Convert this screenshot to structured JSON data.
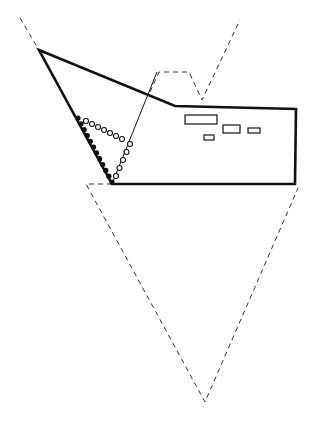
{
  "diagram": {
    "type": "technical line drawing",
    "background": "#ffffff",
    "stroke_color": "#111111",
    "outline": {
      "description": "solid thick outline of object (sloped nose, cabin step, flat body)",
      "points": [
        [
          39,
          50
        ],
        [
          175,
          106
        ],
        [
          296,
          109
        ],
        [
          295,
          184
        ],
        [
          112,
          184
        ]
      ]
    },
    "thin_line": {
      "from": [
        112,
        184
      ],
      "to": [
        157,
        72
      ]
    },
    "dashed_top_left": {
      "from": [
        20,
        18
      ],
      "to": [
        39,
        50
      ]
    },
    "dashed_top_right": {
      "points": [
        [
          150,
          92
        ],
        [
          159,
          72
        ],
        [
          189,
          72
        ],
        [
          202,
          100
        ],
        [
          240,
          20
        ]
      ]
    },
    "dashed_lower_triangle": {
      "points": [
        [
          112,
          184
        ],
        [
          86,
          184
        ],
        [
          205,
          402
        ],
        [
          298,
          188
        ]
      ]
    },
    "windows": [
      {
        "x": 185,
        "y": 115,
        "w": 32,
        "h": 9
      },
      {
        "x": 223,
        "y": 125,
        "w": 17,
        "h": 8
      },
      {
        "x": 248,
        "y": 128,
        "w": 12,
        "h": 5
      },
      {
        "x": 204,
        "y": 135,
        "w": 10,
        "h": 5
      }
    ],
    "filled_dots": {
      "from": [
        78,
        118
      ],
      "to": [
        112,
        182
      ],
      "count": 12
    },
    "open_circles_row": {
      "from": [
        86,
        121
      ],
      "to": [
        122,
        139
      ],
      "count": 7
    },
    "open_circles_diag": {
      "from": [
        116,
        176
      ],
      "to": [
        130,
        144
      ],
      "count": 5
    }
  }
}
